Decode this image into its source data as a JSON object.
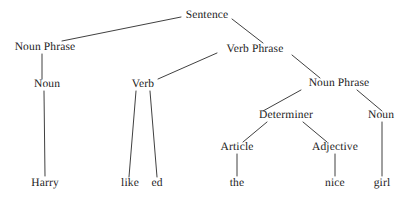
{
  "diagram": {
    "type": "syntax-tree",
    "sentence": "Harry like ed the nice girl",
    "line_color": "#2a2a2a",
    "text_color": "#1b1b1b",
    "background_color": "#ffffff",
    "nodes": [
      {
        "id": "sentence",
        "label": "Sentence",
        "x": 207,
        "y": 18,
        "kind": "nonterminal"
      },
      {
        "id": "np1",
        "label": "Noun Phrase",
        "x": 45,
        "y": 50,
        "kind": "nonterminal"
      },
      {
        "id": "vp",
        "label": "Verb Phrase",
        "x": 255,
        "y": 52,
        "kind": "nonterminal"
      },
      {
        "id": "noun1",
        "label": "Noun",
        "x": 47,
        "y": 87,
        "kind": "nonterminal"
      },
      {
        "id": "verb",
        "label": "Verb",
        "x": 143,
        "y": 87,
        "kind": "nonterminal"
      },
      {
        "id": "np2",
        "label": "Noun Phrase",
        "x": 339,
        "y": 86,
        "kind": "nonterminal"
      },
      {
        "id": "determiner",
        "label": "Determiner",
        "x": 286,
        "y": 118,
        "kind": "nonterminal"
      },
      {
        "id": "noun2",
        "label": "Noun",
        "x": 381,
        "y": 118,
        "kind": "nonterminal"
      },
      {
        "id": "article",
        "label": "Article",
        "x": 237,
        "y": 150,
        "kind": "nonterminal"
      },
      {
        "id": "adjective",
        "label": "Adjective",
        "x": 335,
        "y": 150,
        "kind": "nonterminal"
      }
    ],
    "leaves": [
      {
        "id": "harry",
        "label": "Harry",
        "x": 45,
        "y": 186
      },
      {
        "id": "like",
        "label": "like",
        "x": 130,
        "y": 186
      },
      {
        "id": "ed",
        "label": "ed",
        "x": 157,
        "y": 186
      },
      {
        "id": "the",
        "label": "the",
        "x": 237,
        "y": 186
      },
      {
        "id": "nice",
        "label": "nice",
        "x": 335,
        "y": 186
      },
      {
        "id": "girl",
        "label": "girl",
        "x": 382,
        "y": 186
      }
    ],
    "edges": [
      {
        "from": "sentence",
        "to": "np1",
        "x1": 181,
        "y1": 17,
        "x2": 62,
        "y2": 41
      },
      {
        "from": "sentence",
        "to": "vp",
        "x1": 232,
        "y1": 19,
        "x2": 263,
        "y2": 43
      },
      {
        "from": "np1",
        "to": "noun1",
        "x1": 42,
        "y1": 54,
        "x2": 42,
        "y2": 79
      },
      {
        "from": "vp",
        "to": "verb",
        "x1": 217,
        "y1": 53,
        "x2": 158,
        "y2": 79
      },
      {
        "from": "vp",
        "to": "np2",
        "x1": 292,
        "y1": 55,
        "x2": 320,
        "y2": 78
      },
      {
        "from": "noun1",
        "to": "harry",
        "x1": 44,
        "y1": 91,
        "x2": 45,
        "y2": 176
      },
      {
        "from": "verb",
        "to": "like",
        "x1": 136,
        "y1": 91,
        "x2": 129,
        "y2": 177
      },
      {
        "from": "verb",
        "to": "ed",
        "x1": 150,
        "y1": 91,
        "x2": 157,
        "y2": 177
      },
      {
        "from": "np2",
        "to": "determiner",
        "x1": 301,
        "y1": 90,
        "x2": 263,
        "y2": 111
      },
      {
        "from": "np2",
        "to": "noun2",
        "x1": 357,
        "y1": 90,
        "x2": 382,
        "y2": 111
      },
      {
        "from": "determiner",
        "to": "article",
        "x1": 267,
        "y1": 122,
        "x2": 243,
        "y2": 142
      },
      {
        "from": "determiner",
        "to": "adjective",
        "x1": 303,
        "y1": 122,
        "x2": 327,
        "y2": 142
      },
      {
        "from": "article",
        "to": "the",
        "x1": 237,
        "y1": 154,
        "x2": 237,
        "y2": 176
      },
      {
        "from": "adjective",
        "to": "nice",
        "x1": 335,
        "y1": 154,
        "x2": 335,
        "y2": 176
      },
      {
        "from": "noun2",
        "to": "girl",
        "x1": 382,
        "y1": 122,
        "x2": 382,
        "y2": 176
      }
    ]
  }
}
